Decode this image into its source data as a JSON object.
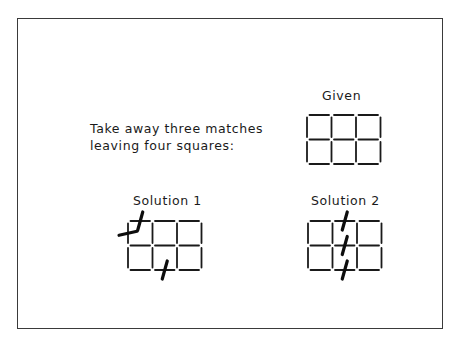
{
  "instruction": {
    "line1": "Take away three matches",
    "line2": "leaving four squares:"
  },
  "panels": [
    {
      "id": "given",
      "title": "Given",
      "grid": {
        "cols": 3,
        "rows": 2
      },
      "removed": []
    },
    {
      "id": "solution-1",
      "title": "Solution 1",
      "grid": {
        "cols": 3,
        "rows": 2
      },
      "removed": [
        {
          "orientation": "h",
          "row": 0,
          "col": 0
        },
        {
          "orientation": "v",
          "row": 0,
          "col": 0
        },
        {
          "orientation": "h",
          "row": 2,
          "col": 1
        }
      ]
    },
    {
      "id": "solution-2",
      "title": "Solution 2",
      "grid": {
        "cols": 3,
        "rows": 2
      },
      "removed": [
        {
          "orientation": "h",
          "row": 0,
          "col": 1
        },
        {
          "orientation": "h",
          "row": 1,
          "col": 1
        },
        {
          "orientation": "h",
          "row": 2,
          "col": 1
        }
      ]
    }
  ],
  "colors": {
    "ink": "#1a1a1a",
    "frame": "#3a3a3a",
    "background": "#ffffff"
  }
}
